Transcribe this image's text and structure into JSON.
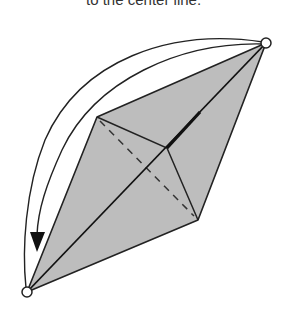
{
  "caption": "to the center line.",
  "diagram": {
    "type": "origami-fold-step",
    "fill_color": "#c0c0c0",
    "stroke_color": "#222222",
    "markers": [
      "top-right-point",
      "bottom-left-point"
    ],
    "arrow": "valley-fold-arrow from top-right point to bottom-left point"
  }
}
